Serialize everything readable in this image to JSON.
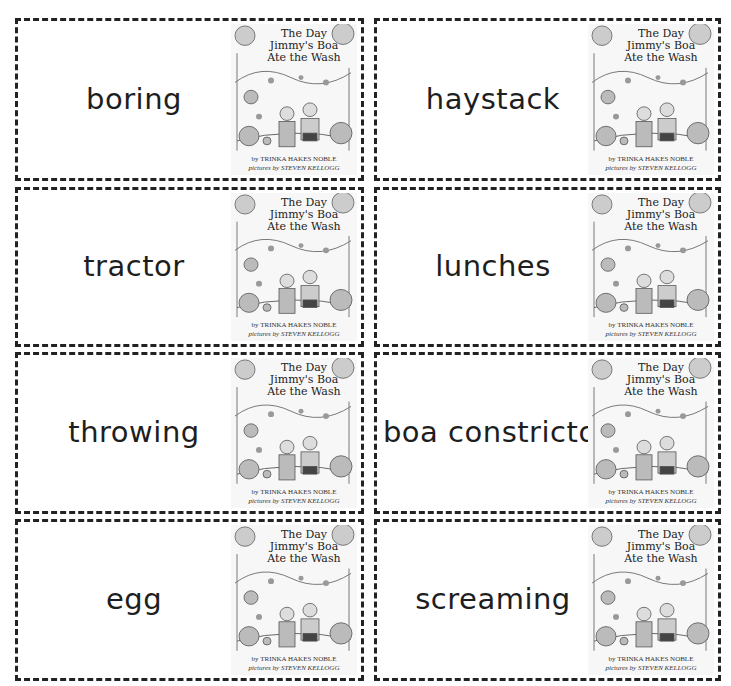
{
  "cards": [
    {
      "word": "boring",
      "x": 15,
      "y": 18,
      "w": 349,
      "h": 163
    },
    {
      "word": "haystack",
      "x": 374,
      "y": 18,
      "w": 347,
      "h": 163
    },
    {
      "word": "tractor",
      "x": 15,
      "y": 187,
      "w": 349,
      "h": 160
    },
    {
      "word": "lunches",
      "x": 374,
      "y": 187,
      "w": 347,
      "h": 160
    },
    {
      "word": "throwing",
      "x": 15,
      "y": 352,
      "w": 349,
      "h": 162
    },
    {
      "word": "boa constrictor",
      "x": 374,
      "y": 352,
      "w": 347,
      "h": 162
    },
    {
      "word": "egg",
      "x": 15,
      "y": 519,
      "w": 349,
      "h": 162
    },
    {
      "word": "screaming",
      "x": 374,
      "y": 519,
      "w": 347,
      "h": 162
    }
  ],
  "cover": {
    "title_line1": "The Day",
    "title_line2": "Jimmy's Boa",
    "title_line3": "Ate the Wash",
    "author": "by TRINKA HAKES NOBLE",
    "illustrator": "pictures by STEVEN KELLOGG"
  }
}
